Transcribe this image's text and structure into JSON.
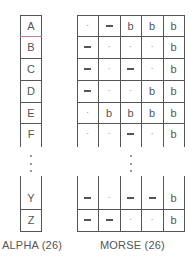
{
  "alpha": {
    "label": "ALPHA (26)",
    "top_rows": [
      "A",
      "B",
      "C",
      "D",
      "E",
      "F"
    ],
    "bottom_rows": [
      "Y",
      "Z"
    ],
    "highlight_border_color": "#c77a8a"
  },
  "morse": {
    "label": "MORSE (26)",
    "top_rows": [
      [
        ".",
        "-",
        "b",
        "b",
        "b"
      ],
      [
        "-",
        ".",
        ".",
        ".",
        "b"
      ],
      [
        "-",
        ".",
        "-",
        ".",
        "b"
      ],
      [
        "-",
        ".",
        ".",
        "b",
        "b"
      ],
      [
        ".",
        "b",
        "b",
        "b",
        "b"
      ],
      [
        ".",
        ".",
        "-",
        ".",
        "b"
      ]
    ],
    "bottom_rows": [
      [
        "-",
        ".",
        "-",
        "-",
        "b"
      ],
      [
        "-",
        "-",
        ".",
        ".",
        "b"
      ]
    ]
  },
  "ellipsis": "vertical-ellipsis"
}
